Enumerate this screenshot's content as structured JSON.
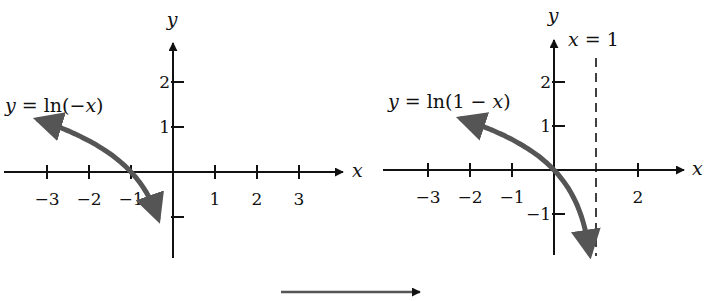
{
  "chart_data": [
    {
      "type": "line",
      "function": "y = ln(-x)",
      "label": "y = ln(−x)",
      "xlabel": "x",
      "ylabel": "y",
      "xticks": [
        -3,
        -2,
        -1,
        1,
        2,
        3
      ],
      "xtick_labels": [
        "−3",
        "−2",
        "−1",
        "1",
        "2",
        "3"
      ],
      "yticks": [
        2,
        1,
        -1
      ],
      "ytick_labels": [
        "2",
        "1",
        ""
      ],
      "xlim": [
        -4,
        4
      ],
      "ylim": [
        -2,
        3
      ],
      "domain": [
        -3.2,
        -0.36
      ],
      "asymptote": null,
      "curve_color": "#555555",
      "grid": false
    },
    {
      "type": "line",
      "function": "y = ln(1 - x)",
      "label": "y = ln(1 − x)",
      "xlabel": "x",
      "ylabel": "y",
      "xticks": [
        -3,
        -2,
        -1,
        2
      ],
      "xtick_labels": [
        "−3",
        "−2",
        "−1",
        "2"
      ],
      "yticks": [
        2,
        1,
        -1
      ],
      "ytick_labels": [
        "2",
        "1",
        "−1"
      ],
      "xlim": [
        -4,
        3
      ],
      "ylim": [
        -2,
        3
      ],
      "domain": [
        -2.2,
        0.85
      ],
      "asymptote": {
        "x": 1,
        "label": "x = 1"
      },
      "curve_color": "#555555",
      "grid": false
    }
  ],
  "transform_arrow": {
    "direction": "right"
  }
}
